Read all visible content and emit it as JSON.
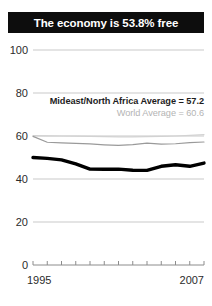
{
  "title": "The economy is 53.8% free",
  "theme": {
    "banner_bg": "#0d0d0d",
    "banner_text": "#ffffff",
    "axis_text": "#2b2b2b",
    "gridline": "#c9c9c9",
    "country_line": "#000000",
    "region_line": "#9a9a9a",
    "world_line": "#d2d2d2",
    "region_label": "#1d1d1d",
    "world_label": "#b4b4b4"
  },
  "annotations": {
    "region": "Mideast/North Africa Average = 57.2",
    "world": "World Average = 60.6"
  },
  "axis": {
    "y_ticks": [
      "100",
      "80",
      "60",
      "40",
      "20",
      "0"
    ],
    "x_start": "1995",
    "x_end": "2007"
  },
  "chart_data": {
    "type": "line",
    "title": "The economy is 53.8% free",
    "xlabel": "",
    "ylabel": "",
    "ylim": [
      0,
      100
    ],
    "yticks": [
      0,
      20,
      40,
      60,
      80,
      100
    ],
    "grid": true,
    "legend": "none",
    "x": [
      1995,
      1996,
      1997,
      1998,
      1999,
      2000,
      2001,
      2002,
      2003,
      2004,
      2005,
      2006,
      2007
    ],
    "xticklabels_shown": [
      "1995",
      "2007"
    ],
    "series": [
      {
        "name": "Country economic freedom",
        "color": "#000000",
        "width": "thick",
        "values": [
          50.0,
          49.6,
          48.9,
          47.0,
          44.6,
          44.5,
          44.6,
          44.1,
          44.0,
          45.9,
          46.6,
          45.9,
          47.4
        ]
      },
      {
        "name": "Mideast/North Africa Average",
        "color": "#9a9a9a",
        "width": "thin",
        "average": 57.2,
        "values": [
          59.8,
          57.1,
          56.8,
          56.6,
          56.3,
          55.9,
          55.6,
          56.0,
          56.7,
          56.2,
          56.4,
          56.9,
          57.2
        ]
      },
      {
        "name": "World Average",
        "color": "#d2d2d2",
        "width": "thin",
        "average": 60.6,
        "values": [
          60.2,
          60.1,
          60.0,
          59.9,
          59.8,
          59.7,
          59.6,
          59.6,
          59.7,
          59.8,
          60.0,
          60.3,
          60.6
        ]
      }
    ],
    "endpoint_label": {
      "country_2007": 53.8,
      "region_2007": 57.2,
      "world_2007": 60.6
    }
  }
}
